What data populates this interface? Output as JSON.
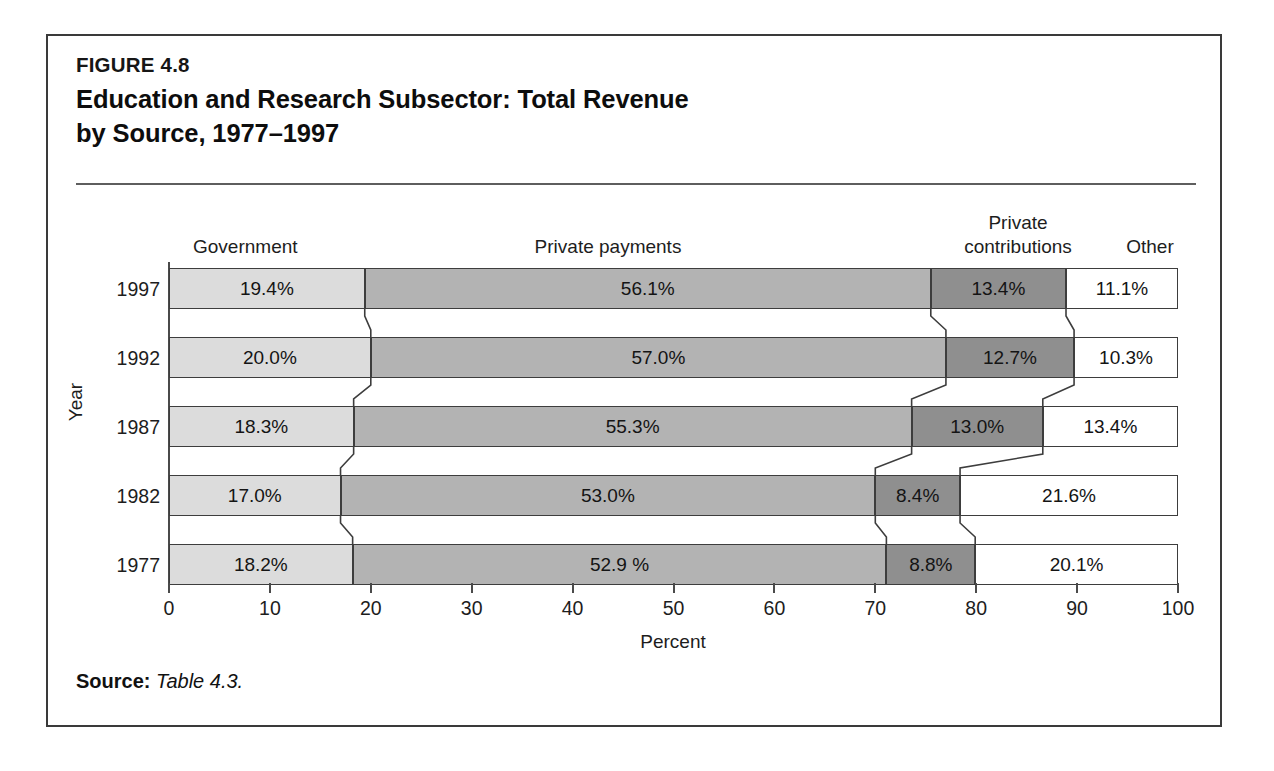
{
  "figure": {
    "number": "FIGURE 4.8",
    "title_line1": "Education and Research Subsector: Total Revenue",
    "title_line2": "by Source, 1977–1997",
    "source_label": "Source:",
    "source_value": "Table 4.3."
  },
  "colors": {
    "government": "#dcdcdc",
    "private_payments": "#b3b3b3",
    "private_contributions": "#8f8f8f",
    "other": "#ffffff",
    "outline": "#3d3d3d",
    "frame": "#3a3a3a",
    "text": "#141414"
  },
  "chart_data": {
    "type": "bar",
    "orientation": "horizontal",
    "stacked": true,
    "stack_mode": "percent",
    "title": "Education and Research Subsector: Total Revenue by Source, 1977–1997",
    "xlabel": "Percent",
    "ylabel": "Year",
    "xlim": [
      0,
      100
    ],
    "xticks": [
      0,
      10,
      20,
      30,
      40,
      50,
      60,
      70,
      80,
      90,
      100
    ],
    "xtick_labels": [
      "0",
      "10",
      "20",
      "30",
      "40",
      "50",
      "60",
      "70",
      "80",
      "90",
      "100"
    ],
    "grid": false,
    "legend": "column-headers-above-bars",
    "categories": [
      "1997",
      "1992",
      "1987",
      "1982",
      "1977"
    ],
    "series": [
      {
        "name": "Government",
        "color": "#dcdcdc",
        "values": [
          19.4,
          20.0,
          18.3,
          17.0,
          18.2
        ],
        "labels": [
          "19.4%",
          "20.0%",
          "18.3%",
          "17.0%",
          "18.2%"
        ]
      },
      {
        "name": "Private payments",
        "color": "#b3b3b3",
        "values": [
          56.1,
          57.0,
          55.3,
          53.0,
          52.9
        ],
        "labels": [
          "56.1%",
          "57.0%",
          "55.3%",
          "53.0%",
          "52.9 %"
        ]
      },
      {
        "name": "Private contributions",
        "color": "#8f8f8f",
        "values": [
          13.4,
          12.7,
          13.0,
          8.4,
          8.8
        ],
        "labels": [
          "13.4%",
          "12.7%",
          "13.0%",
          "8.4%",
          "8.8%"
        ]
      },
      {
        "name": "Other",
        "color": "#ffffff",
        "values": [
          11.1,
          10.3,
          13.4,
          21.6,
          20.1
        ],
        "labels": [
          "11.1%",
          "10.3%",
          "13.4%",
          "21.6%",
          "20.1%"
        ]
      }
    ]
  },
  "headers": {
    "government": "Government",
    "private_payments": "Private payments",
    "private_contributions_line1": "Private",
    "private_contributions_line2": "contributions",
    "other": "Other"
  }
}
